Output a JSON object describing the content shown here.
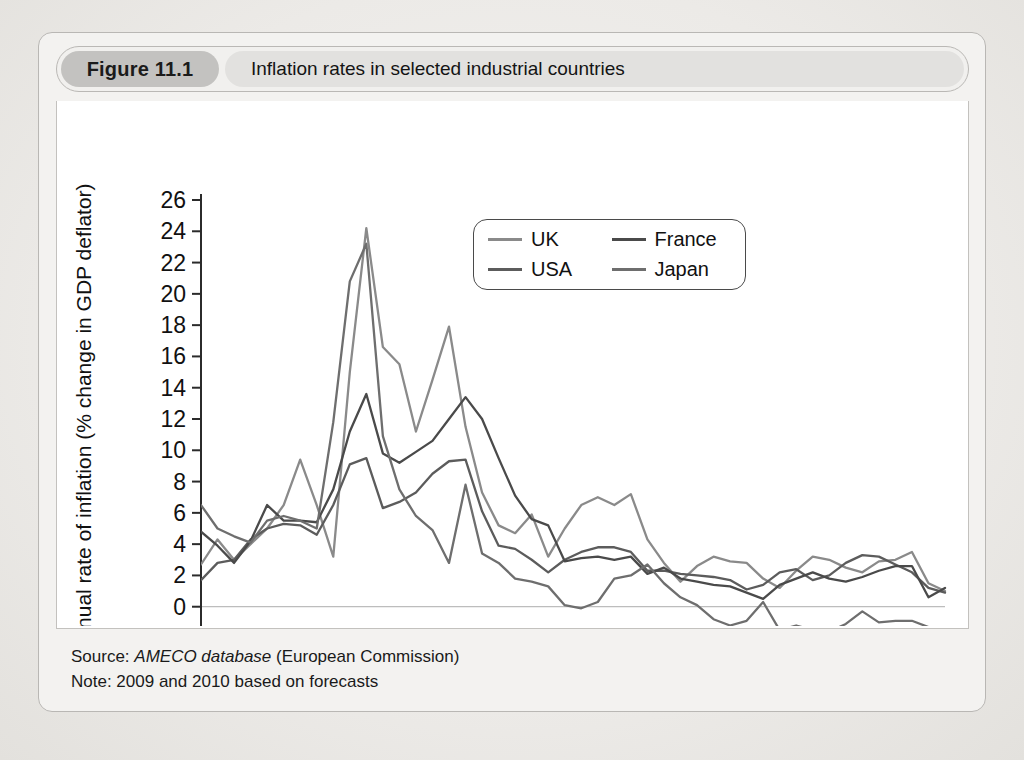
{
  "figure": {
    "number_label": "Figure 11.1",
    "title": "Inflation rates in selected industrial countries",
    "source_prefix": "Source: ",
    "source_em": "AMECO database",
    "source_suffix": " (European Commission)",
    "note": "Note: 2009 and 2010 based on forecasts"
  },
  "legend": {
    "position": "inside-top-center-right",
    "items": [
      {
        "label": "UK",
        "color": "#8a8a8a"
      },
      {
        "label": "France",
        "color": "#4a4a4a"
      },
      {
        "label": "USA",
        "color": "#5c5c5c"
      },
      {
        "label": "Japan",
        "color": "#6e6e6e"
      }
    ]
  },
  "chart_data": {
    "type": "line",
    "title": "Inflation rates in selected industrial countries",
    "xlabel": "",
    "ylabel": "Annual rate of inflation (% change in GDP deflator)",
    "xlim": [
      1965,
      2010
    ],
    "ylim": [
      -2,
      26
    ],
    "ytick_step": 2,
    "yticks": [
      -2,
      0,
      2,
      4,
      6,
      8,
      10,
      12,
      14,
      16,
      18,
      20,
      22,
      24,
      26
    ],
    "xticks_labeled": [
      1965,
      1970,
      1975,
      1980,
      1985,
      1990,
      1995,
      2000,
      2005,
      2010
    ],
    "xtick_minor_step": 1,
    "grid": false,
    "zero_line": true,
    "x": [
      1965,
      1966,
      1967,
      1968,
      1969,
      1970,
      1971,
      1972,
      1973,
      1974,
      1975,
      1976,
      1977,
      1978,
      1979,
      1980,
      1981,
      1982,
      1983,
      1984,
      1985,
      1986,
      1987,
      1988,
      1989,
      1990,
      1991,
      1992,
      1993,
      1994,
      1995,
      1996,
      1997,
      1998,
      1999,
      2000,
      2001,
      2002,
      2003,
      2004,
      2005,
      2006,
      2007,
      2008,
      2009,
      2010
    ],
    "series": [
      {
        "name": "UK",
        "color": "#8a8a8a",
        "values": [
          2.7,
          4.3,
          3.0,
          4.0,
          5.0,
          6.5,
          9.4,
          6.5,
          3.2,
          15.0,
          24.2,
          16.6,
          15.5,
          11.2,
          14.5,
          17.9,
          11.5,
          7.3,
          5.2,
          4.7,
          5.9,
          3.2,
          5.0,
          6.5,
          7.0,
          6.5,
          7.2,
          4.3,
          2.8,
          1.6,
          2.6,
          3.2,
          2.9,
          2.8,
          1.8,
          1.2,
          2.3,
          3.2,
          3.0,
          2.5,
          2.2,
          2.9,
          3.0,
          3.5,
          1.5,
          1.0
        ]
      },
      {
        "name": "USA",
        "color": "#5c5c5c",
        "values": [
          1.7,
          2.8,
          3.0,
          4.3,
          5.0,
          5.3,
          5.2,
          4.6,
          6.5,
          9.1,
          9.5,
          6.3,
          6.7,
          7.3,
          8.5,
          9.3,
          9.4,
          6.1,
          3.9,
          3.7,
          3.0,
          2.2,
          3.0,
          3.5,
          3.8,
          3.8,
          3.5,
          2.3,
          2.3,
          2.1,
          2.0,
          1.9,
          1.7,
          1.1,
          1.4,
          2.2,
          2.4,
          1.7,
          2.0,
          2.8,
          3.3,
          3.2,
          2.7,
          2.2,
          1.2,
          0.9
        ]
      },
      {
        "name": "France",
        "color": "#4a4a4a",
        "values": [
          4.8,
          3.9,
          2.8,
          4.2,
          6.5,
          5.5,
          5.5,
          5.4,
          7.5,
          11.2,
          13.6,
          9.8,
          9.2,
          9.9,
          10.6,
          12.0,
          13.4,
          12.0,
          9.5,
          7.1,
          5.6,
          5.2,
          2.9,
          3.1,
          3.2,
          3.0,
          3.2,
          2.1,
          2.5,
          1.8,
          1.6,
          1.4,
          1.3,
          0.9,
          0.5,
          1.4,
          1.8,
          2.2,
          1.8,
          1.6,
          1.9,
          2.3,
          2.6,
          2.6,
          0.6,
          1.2
        ]
      },
      {
        "name": "Japan",
        "color": "#6e6e6e",
        "values": [
          6.5,
          5.0,
          4.5,
          4.1,
          5.5,
          5.8,
          5.5,
          5.0,
          11.8,
          20.8,
          23.2,
          10.9,
          7.5,
          5.8,
          4.9,
          2.8,
          7.8,
          3.4,
          2.8,
          1.8,
          1.6,
          1.3,
          0.1,
          -0.1,
          0.3,
          1.8,
          2.0,
          2.7,
          1.5,
          0.6,
          0.1,
          -0.8,
          -1.2,
          -0.9,
          0.3,
          -1.5,
          -1.2,
          -1.5,
          -1.6,
          -1.1,
          -0.3,
          -1.0,
          -0.9,
          -0.9,
          -1.3,
          -1.3
        ]
      }
    ]
  },
  "axes": {
    "y_axis_title": "Annual rate of inflation (% change in GDP deflator)"
  }
}
